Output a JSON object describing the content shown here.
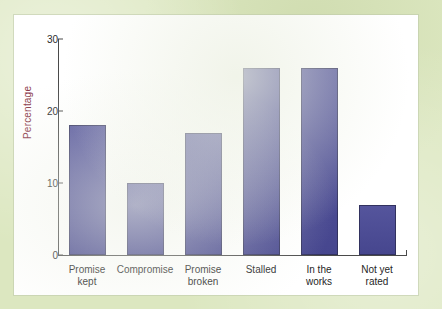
{
  "figure": {
    "mat_color": "#dce7c0",
    "card_color": "#ffffff",
    "bar_color": "#4a4a96",
    "bar_outline_color": "#32325f",
    "axis_color": "#4a4a4a",
    "axis_title_color": "#8c3a4a"
  },
  "chart_data": {
    "type": "bar",
    "title": "",
    "xlabel": "",
    "ylabel": "Percentage",
    "categories": [
      "Promise\nkept",
      "Compromise",
      "Promise\nbroken",
      "Stalled",
      "In the\nworks",
      "Not yet\nrated"
    ],
    "values": [
      18,
      10,
      17,
      26,
      26,
      7
    ],
    "ylim": [
      0,
      30
    ],
    "yticks": [
      0,
      10,
      20,
      30
    ],
    "ytick_labels": [
      "0",
      "10",
      "20",
      "30"
    ],
    "grid": false,
    "legend": null
  }
}
